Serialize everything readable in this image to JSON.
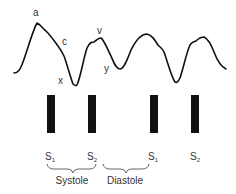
{
  "waveform": {
    "color": "#111111",
    "labels": {
      "a": "a",
      "c": "c",
      "x": "x",
      "v": "v",
      "y": "y"
    }
  },
  "heart_sounds": [
    {
      "label": "S",
      "sub": "1"
    },
    {
      "label": "S",
      "sub": "2"
    },
    {
      "label": "S",
      "sub": "1"
    },
    {
      "label": "S",
      "sub": "2"
    }
  ],
  "phases": {
    "systole": "Systole",
    "diastole": "Diastole"
  }
}
